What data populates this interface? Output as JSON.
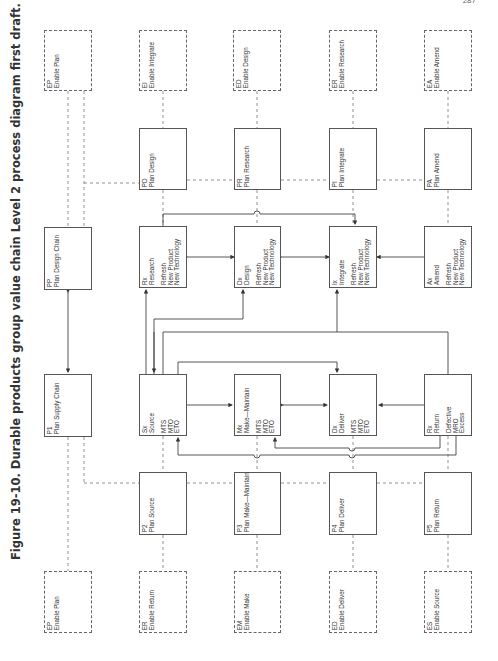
{
  "page_number": "287",
  "caption": "Figure 19-10. Durable products group value chain Level 2 process diagram first draft.",
  "enable_top": [
    {
      "code": "EP",
      "name": "Enable Plan"
    },
    {
      "code": "EI",
      "name": "Enable Integrate"
    },
    {
      "code": "ED",
      "name": "Enable Design"
    },
    {
      "code": "ER",
      "name": "Enable Research"
    },
    {
      "code": "EA",
      "name": "Enable Amend"
    }
  ],
  "plan_design": [
    {
      "code": "PD",
      "name": "Plan Design"
    },
    {
      "code": "PR",
      "name": "Plan Research"
    },
    {
      "code": "PI",
      "name": "Plan Integrate"
    },
    {
      "code": "PA",
      "name": "Plan Amend"
    }
  ],
  "chains": [
    {
      "code": "PP",
      "name": "Plan Design Chain"
    },
    {
      "code": "P1",
      "name": "Plan Supply Chain"
    }
  ],
  "design_exec": [
    {
      "code": "Rx",
      "name": "Research",
      "options": [
        "Refresh",
        "New Product",
        "New Technology"
      ]
    },
    {
      "code": "Dx",
      "name": "Design",
      "options": [
        "Refresh",
        "New Product",
        "New Technology"
      ]
    },
    {
      "code": "Ix",
      "name": "Integrate",
      "options": [
        "Refresh",
        "New Product",
        "New Technology"
      ]
    },
    {
      "code": "Ax",
      "name": "Amend",
      "options": [
        "Refresh",
        "New Product",
        "New Technology"
      ]
    }
  ],
  "supply_exec": [
    {
      "code": "Sx",
      "name": "Source",
      "options": [
        "MTS",
        "MTO",
        "ETO"
      ]
    },
    {
      "code": "Mx",
      "name": "Make—Maintain",
      "options": [
        "MTS",
        "MTO",
        "ETO"
      ]
    },
    {
      "code": "Dx",
      "name": "Deliver",
      "options": [
        "MTS",
        "MTO",
        "ETO"
      ]
    },
    {
      "code": "Rx",
      "name": "Return",
      "options": [
        "Defective",
        "MRO",
        "Excess"
      ]
    }
  ],
  "plan_supply": [
    {
      "code": "P2",
      "name": "Plan Source"
    },
    {
      "code": "P3",
      "name": "Plan Make—Maintain"
    },
    {
      "code": "P4",
      "name": "Plan Deliver"
    },
    {
      "code": "P5",
      "name": "Plan Return"
    }
  ],
  "enable_bottom": [
    {
      "code": "EP",
      "name": "Enable Plan"
    },
    {
      "code": "ER",
      "name": "Enable Return"
    },
    {
      "code": "EM",
      "name": "Enable Make"
    },
    {
      "code": "ED",
      "name": "Enable Deliver"
    },
    {
      "code": "ES",
      "name": "Enable Source"
    }
  ]
}
